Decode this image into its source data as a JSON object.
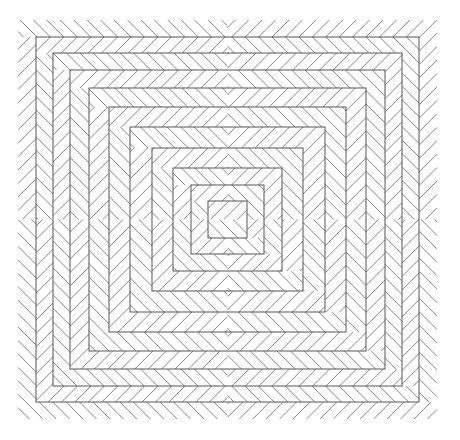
{
  "figure": {
    "kind": "geometric-line-pattern",
    "canvas": {
      "width": 460,
      "height": 440,
      "background_color": "#ffffff"
    },
    "plate": {
      "left": 18,
      "top": 20,
      "right": 437,
      "bottom": 419,
      "width": 419,
      "height": 399,
      "center_x": 227.5,
      "center_y": 219.5
    },
    "style": {
      "outline_color": "#555555",
      "outline_width": 1,
      "hatch_color": "#6b6b6b",
      "hatch_width": 0.85,
      "hatch_angle_degrees": 45,
      "hatch_spacing": 9.5
    },
    "ring_count": 10,
    "band_count": 10,
    "rings": [
      {
        "index": 0,
        "inset_x": 0,
        "inset_y": 0,
        "half_width": 209.5,
        "half_height": 199.5,
        "outline_drawn": false
      },
      {
        "index": 1,
        "inset_x": 18,
        "inset_y": 17,
        "half_width": 191.5,
        "half_height": 182.5,
        "outline_drawn": true
      },
      {
        "index": 2,
        "inset_x": 35,
        "inset_y": 33,
        "half_width": 174.5,
        "half_height": 166.5,
        "outline_drawn": true
      },
      {
        "index": 3,
        "inset_x": 52,
        "inset_y": 50,
        "half_width": 157.5,
        "half_height": 149.5,
        "outline_drawn": true
      },
      {
        "index": 4,
        "inset_x": 71,
        "inset_y": 68,
        "half_width": 138.5,
        "half_height": 131.5,
        "outline_drawn": true
      },
      {
        "index": 5,
        "inset_x": 91,
        "inset_y": 87,
        "half_width": 118.5,
        "half_height": 112.5,
        "outline_drawn": true
      },
      {
        "index": 6,
        "inset_x": 112,
        "inset_y": 107,
        "half_width": 97.5,
        "half_height": 92.5,
        "outline_drawn": true
      },
      {
        "index": 7,
        "inset_x": 134,
        "inset_y": 128,
        "half_width": 75.5,
        "half_height": 71.5,
        "outline_drawn": true
      },
      {
        "index": 8,
        "inset_x": 155,
        "inset_y": 148,
        "half_width": 54.5,
        "half_height": 51.5,
        "outline_drawn": true
      },
      {
        "index": 9,
        "inset_x": 173,
        "inset_y": 165,
        "half_width": 36.5,
        "half_height": 34.5,
        "outline_drawn": true
      },
      {
        "index": 10,
        "inset_x": 190,
        "inset_y": 181,
        "half_width": 19.5,
        "half_height": 18.5,
        "outline_drawn": true
      }
    ],
    "bands": [
      {
        "index": 0,
        "outer_ring": 0,
        "inner_ring": 1,
        "hatch_slope": 1,
        "description": "outermost band, hatch tilted one way"
      },
      {
        "index": 1,
        "outer_ring": 1,
        "inner_ring": 2,
        "hatch_slope": -1,
        "description": "second band, hatch mirrored"
      },
      {
        "index": 2,
        "outer_ring": 2,
        "inner_ring": 3,
        "hatch_slope": 1,
        "description": "third band"
      },
      {
        "index": 3,
        "outer_ring": 3,
        "inner_ring": 4,
        "hatch_slope": -1,
        "description": "fourth band"
      },
      {
        "index": 4,
        "outer_ring": 4,
        "inner_ring": 5,
        "hatch_slope": 1,
        "description": "fifth band"
      },
      {
        "index": 5,
        "outer_ring": 5,
        "inner_ring": 6,
        "hatch_slope": -1,
        "description": "sixth band"
      },
      {
        "index": 6,
        "outer_ring": 6,
        "inner_ring": 7,
        "hatch_slope": 1,
        "description": "seventh band"
      },
      {
        "index": 7,
        "outer_ring": 7,
        "inner_ring": 8,
        "hatch_slope": -1,
        "description": "eighth band"
      },
      {
        "index": 8,
        "outer_ring": 8,
        "inner_ring": 9,
        "hatch_slope": 1,
        "description": "ninth band"
      },
      {
        "index": 9,
        "outer_ring": 9,
        "inner_ring": 10,
        "hatch_slope": -1,
        "description": "tenth band"
      },
      {
        "index": 10,
        "outer_ring": 10,
        "inner_ring": null,
        "hatch_slope": 1,
        "description": "innermost core square, chevron filled"
      }
    ]
  }
}
